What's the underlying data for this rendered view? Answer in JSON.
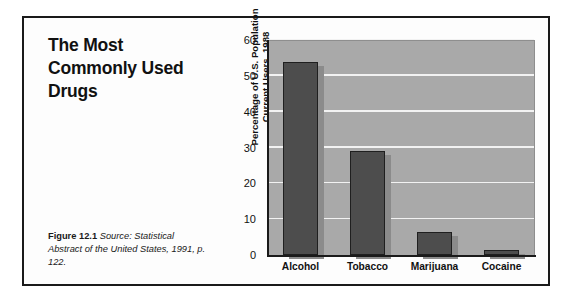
{
  "figure": {
    "title": "The Most Commonly Used Drugs",
    "title_lines": [
      "The Most",
      "Commonly Used",
      "Drugs"
    ],
    "caption_label": "Figure 12.1",
    "caption_source": "Source: Statistical Abstract of the United States, 1991, p. 122."
  },
  "colors": {
    "plot_background": "#a9a9a9",
    "bar_fill": "#4d4d4d",
    "bar_outline": "#1f1f1f",
    "bar_shadow": "#8b8b8b",
    "gridline": "#f2f2f2",
    "axis": "#1a1a1a",
    "frame": "#1a1a1a",
    "page_background": "#ffffff"
  },
  "chart_data": {
    "type": "bar",
    "title": "The Most Commonly Used Drugs",
    "categories": [
      "Alcohol",
      "Tobacco",
      "Marijuana",
      "Cocaine"
    ],
    "values": [
      54,
      29,
      6.5,
      1.5
    ],
    "xlabel": "",
    "ylabel": "Percentage of U.S. Population Current Users, 1988",
    "ylabel_lines": [
      "Percentage of U.S. Population",
      "Current Users, 1988"
    ],
    "ylim": [
      0,
      60
    ],
    "yticks": [
      0,
      10,
      20,
      30,
      40,
      50,
      60
    ],
    "ytick_labels": [
      "0",
      "10",
      "20",
      "30",
      "40",
      "50",
      "60"
    ],
    "grid": true,
    "grid_axis": "y",
    "legend": false
  }
}
